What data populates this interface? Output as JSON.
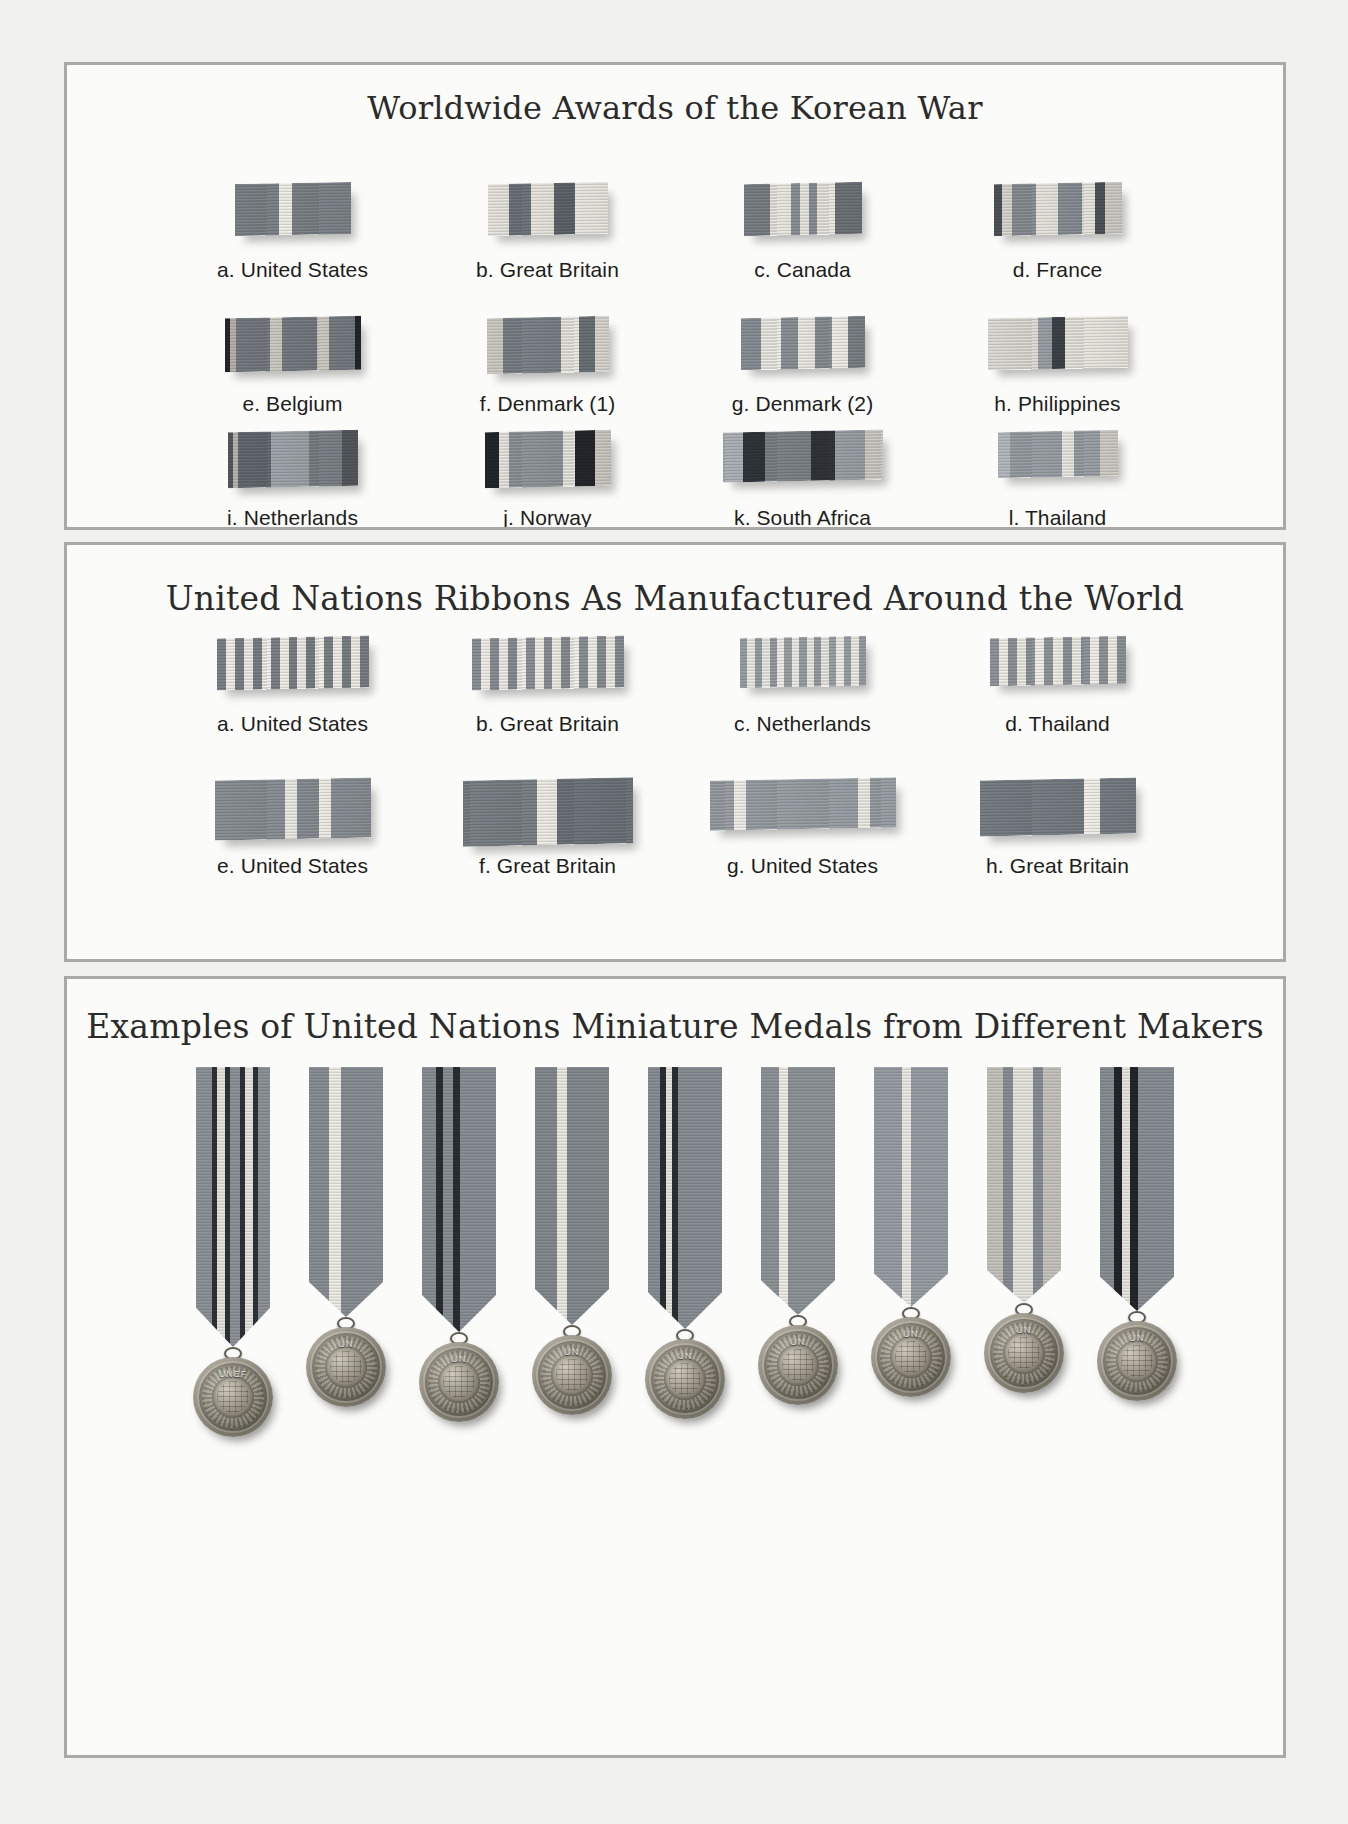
{
  "page": {
    "background": "#f1f1ef",
    "panel_background": "#fbfbf9",
    "panel_border": "#a9aaa8"
  },
  "sections": [
    {
      "id": "korean-war",
      "title": "Worldwide Awards of the Korean War",
      "rows": [
        {
          "items": [
            {
              "label": "a.  United States",
              "width": 116,
              "height": 52,
              "stripes": [
                {
                  "color": "#7d8388",
                  "w": 44
                },
                {
                  "color": "#efeee8",
                  "w": 13
                },
                {
                  "color": "#7d8388",
                  "w": 59
                }
              ]
            },
            {
              "label": "b.  Great Britain",
              "width": 120,
              "height": 52,
              "stripes": [
                {
                  "color": "#e8e6df",
                  "w": 21
                },
                {
                  "color": "#6f757b",
                  "w": 22
                },
                {
                  "color": "#e8e6df",
                  "w": 23
                },
                {
                  "color": "#5f666c",
                  "w": 21
                },
                {
                  "color": "#e8e6df",
                  "w": 33
                }
              ]
            },
            {
              "label": "c.  Canada",
              "width": 118,
              "height": 52,
              "stripes": [
                {
                  "color": "#7b8186",
                  "w": 26
                },
                {
                  "color": "#e9e7e0",
                  "w": 21
                },
                {
                  "color": "#8b9196",
                  "w": 9
                },
                {
                  "color": "#e9e7e0",
                  "w": 9
                },
                {
                  "color": "#8b9196",
                  "w": 8
                },
                {
                  "color": "#e9e7e0",
                  "w": 18
                },
                {
                  "color": "#6d7378",
                  "w": 27
                }
              ]
            },
            {
              "label": "d.  France",
              "width": 128,
              "height": 52,
              "stripes": [
                {
                  "color": "#4d5358",
                  "w": 8
                },
                {
                  "color": "#d9d7d0",
                  "w": 10
                },
                {
                  "color": "#8a9095",
                  "w": 24
                },
                {
                  "color": "#e6e4dd",
                  "w": 22
                },
                {
                  "color": "#8a9095",
                  "w": 24
                },
                {
                  "color": "#e6e4dd",
                  "w": 13
                },
                {
                  "color": "#4d5358",
                  "w": 10
                },
                {
                  "color": "#cfcdc6",
                  "w": 17
                }
              ]
            }
          ]
        },
        {
          "items": [
            {
              "label": "e.  Belgium",
              "width": 136,
              "height": 54,
              "stripes": [
                {
                  "color": "#23262a",
                  "w": 5
                },
                {
                  "color": "#b6b3ab",
                  "w": 6
                },
                {
                  "color": "#767c82",
                  "w": 34
                },
                {
                  "color": "#cbc9c1",
                  "w": 12
                },
                {
                  "color": "#767c82",
                  "w": 35
                },
                {
                  "color": "#cbc9c1",
                  "w": 12
                },
                {
                  "color": "#767c82",
                  "w": 26
                },
                {
                  "color": "#23262a",
                  "w": 6
                }
              ]
            },
            {
              "label": "f.  Denmark (1)",
              "width": 122,
              "height": 56,
              "stripes": [
                {
                  "color": "#cfcdc5",
                  "w": 16
                },
                {
                  "color": "#7c8288",
                  "w": 58
                },
                {
                  "color": "#e9e7e0",
                  "w": 18
                },
                {
                  "color": "#6a7076",
                  "w": 16
                },
                {
                  "color": "#d9d7d0",
                  "w": 14
                }
              ]
            },
            {
              "label": "g.  Denmark (2)",
              "width": 124,
              "height": 52,
              "stripes": [
                {
                  "color": "#8a9095",
                  "w": 20
                },
                {
                  "color": "#ecebe5",
                  "w": 20
                },
                {
                  "color": "#8a9095",
                  "w": 17
                },
                {
                  "color": "#ecebe5",
                  "w": 17
                },
                {
                  "color": "#8a9095",
                  "w": 17
                },
                {
                  "color": "#ecebe5",
                  "w": 16
                },
                {
                  "color": "#7b8186",
                  "w": 17
                }
              ]
            },
            {
              "label": "h.  Philippines",
              "width": 140,
              "height": 52,
              "stripes": [
                {
                  "color": "#dedcd5",
                  "w": 50
                },
                {
                  "color": "#9aa0a5",
                  "w": 14
                },
                {
                  "color": "#3e4349",
                  "w": 13
                },
                {
                  "color": "#e8e6df",
                  "w": 63
                }
              ]
            }
          ]
        },
        {
          "items": [
            {
              "label": "i.  Netherlands",
              "width": 130,
              "height": 56,
              "stripes": [
                {
                  "color": "#55595e",
                  "w": 5
                },
                {
                  "color": "#b9b6ae",
                  "w": 5
                },
                {
                  "color": "#646a70",
                  "w": 33
                },
                {
                  "color": "#9fa5aa",
                  "w": 38
                },
                {
                  "color": "#7b8186",
                  "w": 33
                },
                {
                  "color": "#55595e",
                  "w": 16
                }
              ]
            },
            {
              "label": "j.  Norway",
              "width": 126,
              "height": 56,
              "stripes": [
                {
                  "color": "#23262a",
                  "w": 14
                },
                {
                  "color": "#e9e7e0",
                  "w": 10
                },
                {
                  "color": "#8f9599",
                  "w": 54
                },
                {
                  "color": "#e9e7e0",
                  "w": 12
                },
                {
                  "color": "#23262a",
                  "w": 20
                },
                {
                  "color": "#cbc9c2",
                  "w": 16
                }
              ]
            },
            {
              "label": "k.  South Africa",
              "width": 160,
              "height": 50,
              "stripes": [
                {
                  "color": "#adb2b6",
                  "w": 20
                },
                {
                  "color": "#31353a",
                  "w": 22
                },
                {
                  "color": "#7d8388",
                  "w": 46
                },
                {
                  "color": "#31353a",
                  "w": 24
                },
                {
                  "color": "#9aa0a5",
                  "w": 30
                },
                {
                  "color": "#cfcdc6",
                  "w": 18
                }
              ]
            },
            {
              "label": "l.  Thailand",
              "width": 120,
              "height": 46,
              "stripes": [
                {
                  "color": "#b7bcc0",
                  "w": 12
                },
                {
                  "color": "#9aa0a5",
                  "w": 52
                },
                {
                  "color": "#eceae3",
                  "w": 12
                },
                {
                  "color": "#9aa0a5",
                  "w": 26
                },
                {
                  "color": "#cfcdc6",
                  "w": 18
                }
              ]
            }
          ]
        }
      ]
    },
    {
      "id": "un-ribbons",
      "title": "United Nations Ribbons As Manufactured Around the World",
      "rows": [
        {
          "items": [
            {
              "label": "a. United States",
              "width": 152,
              "height": 52,
              "pattern": "alternating",
              "bands": 17,
              "colors": [
                "#7b8186",
                "#f0eee7"
              ]
            },
            {
              "label": "b. Great Britain",
              "width": 152,
              "height": 52,
              "pattern": "alternating",
              "bands": 17,
              "colors": [
                "#8a9095",
                "#f0eee7"
              ]
            },
            {
              "label": "c.  Netherlands",
              "width": 126,
              "height": 50,
              "pattern": "alternating",
              "bands": 17,
              "colors": [
                "#9aa0a5",
                "#ecebe4"
              ]
            },
            {
              "label": "d.  Thailand",
              "width": 136,
              "height": 48,
              "pattern": "alternating",
              "bands": 15,
              "colors": [
                "#8f9599",
                "#f0eee7"
              ]
            }
          ]
        },
        {
          "items": [
            {
              "label": "e.  United States",
              "width": 156,
              "height": 60,
              "stripes": [
                {
                  "color": "#8a9095",
                  "w": 70
                },
                {
                  "color": "#ecebe4",
                  "w": 12
                },
                {
                  "color": "#8a9095",
                  "w": 22
                },
                {
                  "color": "#ecebe4",
                  "w": 12
                },
                {
                  "color": "#8a9095",
                  "w": 40
                }
              ]
            },
            {
              "label": "f.  Great Britain",
              "width": 170,
              "height": 66,
              "stripes": [
                {
                  "color": "#7b8186",
                  "w": 74
                },
                {
                  "color": "#f0eee7",
                  "w": 20
                },
                {
                  "color": "#6f757b",
                  "w": 76
                }
              ]
            },
            {
              "label": "g. United States",
              "width": 186,
              "height": 50,
              "stripes": [
                {
                  "color": "#9aa0a5",
                  "w": 24
                },
                {
                  "color": "#f0eee7",
                  "w": 12
                },
                {
                  "color": "#9aa0a5",
                  "w": 112
                },
                {
                  "color": "#f0eee7",
                  "w": 12
                },
                {
                  "color": "#9aa0a5",
                  "w": 26
                }
              ]
            },
            {
              "label": "h. Great Britain",
              "width": 156,
              "height": 56,
              "stripes": [
                {
                  "color": "#787e84",
                  "w": 104
                },
                {
                  "color": "#f0eee7",
                  "w": 16
                },
                {
                  "color": "#787e84",
                  "w": 36
                }
              ]
            }
          ]
        }
      ]
    },
    {
      "id": "un-medals",
      "title": "Examples of United Nations Miniature Medals from Different Makers",
      "medals": [
        {
          "name": "medal-1",
          "caption": "UNEF",
          "ribbon_height": 280,
          "stripes": [
            {
              "color": "#8e9499",
              "w": 16
            },
            {
              "color": "#2f3338",
              "w": 5
            },
            {
              "color": "#e9e7e0",
              "w": 8
            },
            {
              "color": "#2f3338",
              "w": 5
            },
            {
              "color": "#8e9499",
              "w": 10
            },
            {
              "color": "#2f3338",
              "w": 5
            },
            {
              "color": "#e9e7e0",
              "w": 8
            },
            {
              "color": "#2f3338",
              "w": 5
            },
            {
              "color": "#8e9499",
              "w": 12
            }
          ]
        },
        {
          "name": "medal-2",
          "caption": "UN",
          "ribbon_height": 250,
          "stripes": [
            {
              "color": "#8a9095",
              "w": 20
            },
            {
              "color": "#f0eee7",
              "w": 12
            },
            {
              "color": "#8a9095",
              "w": 42
            }
          ]
        },
        {
          "name": "medal-3",
          "caption": "UN",
          "ribbon_height": 265,
          "stripes": [
            {
              "color": "#8a9095",
              "w": 14
            },
            {
              "color": "#2b2f34",
              "w": 7
            },
            {
              "color": "#8a9095",
              "w": 10
            },
            {
              "color": "#2b2f34",
              "w": 7
            },
            {
              "color": "#8a9095",
              "w": 36
            }
          ]
        },
        {
          "name": "medal-4",
          "caption": "UN",
          "ribbon_height": 258,
          "stripes": [
            {
              "color": "#858b90",
              "w": 22
            },
            {
              "color": "#ecebe4",
              "w": 10
            },
            {
              "color": "#858b90",
              "w": 42
            }
          ]
        },
        {
          "name": "medal-5",
          "caption": "UN",
          "ribbon_height": 262,
          "stripes": [
            {
              "color": "#8a9095",
              "w": 12
            },
            {
              "color": "#2b2f34",
              "w": 6
            },
            {
              "color": "#e9e7e0",
              "w": 6
            },
            {
              "color": "#2b2f34",
              "w": 6
            },
            {
              "color": "#8a9095",
              "w": 44
            }
          ]
        },
        {
          "name": "medal-6",
          "caption": "UN",
          "ribbon_height": 248,
          "stripes": [
            {
              "color": "#8f9599",
              "w": 18
            },
            {
              "color": "#f0eee7",
              "w": 9
            },
            {
              "color": "#8f9599",
              "w": 47
            }
          ]
        },
        {
          "name": "medal-7",
          "caption": "UN",
          "ribbon_height": 240,
          "stripes": [
            {
              "color": "#9aa0a5",
              "w": 28
            },
            {
              "color": "#ecebe4",
              "w": 9
            },
            {
              "color": "#9aa0a5",
              "w": 37
            }
          ]
        },
        {
          "name": "medal-8",
          "caption": "UN",
          "ribbon_height": 236,
          "stripes": [
            {
              "color": "#c8c6bf",
              "w": 16
            },
            {
              "color": "#8a9095",
              "w": 10
            },
            {
              "color": "#e9e7e0",
              "w": 20
            },
            {
              "color": "#8a9095",
              "w": 10
            },
            {
              "color": "#c8c6bf",
              "w": 18
            }
          ]
        },
        {
          "name": "medal-9",
          "caption": "UN",
          "ribbon_height": 244,
          "stripes": [
            {
              "color": "#8a9095",
              "w": 14
            },
            {
              "color": "#23262a",
              "w": 8
            },
            {
              "color": "#e9e7e0",
              "w": 8
            },
            {
              "color": "#23262a",
              "w": 8
            },
            {
              "color": "#8a9095",
              "w": 36
            }
          ]
        }
      ]
    }
  ]
}
